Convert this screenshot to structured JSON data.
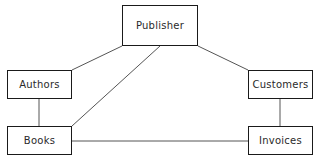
{
  "diagram": {
    "type": "entity-relationship",
    "canvas": {
      "width": 318,
      "height": 165
    },
    "style": {
      "background_color": "#ffffff",
      "box_border_color": "#1a1a1a",
      "box_fill_color": "#ffffff",
      "line_color": "#555555",
      "text_color": "#2a2a2a"
    },
    "nodes": [
      {
        "id": "publisher",
        "label": "Publisher",
        "x": 122,
        "y": 5,
        "width": 76,
        "height": 41
      },
      {
        "id": "authors",
        "label": "Authors",
        "x": 7,
        "y": 70,
        "width": 65,
        "height": 29
      },
      {
        "id": "customers",
        "label": "Customers",
        "x": 248,
        "y": 70,
        "width": 65,
        "height": 29
      },
      {
        "id": "books",
        "label": "Books",
        "x": 7,
        "y": 126,
        "width": 65,
        "height": 29
      },
      {
        "id": "invoices",
        "label": "Invoices",
        "x": 248,
        "y": 126,
        "width": 65,
        "height": 29
      }
    ],
    "edges": [
      {
        "id": "publisher-authors",
        "from": "publisher",
        "to": "authors",
        "x1": 122,
        "y1": 46,
        "x2": 72,
        "y2": 70
      },
      {
        "id": "publisher-customers",
        "from": "publisher",
        "to": "customers",
        "x1": 198,
        "y1": 46,
        "x2": 248,
        "y2": 70
      },
      {
        "id": "publisher-books",
        "from": "publisher",
        "to": "books",
        "x1": 160,
        "y1": 46,
        "x2": 72,
        "y2": 126
      },
      {
        "id": "authors-books",
        "from": "authors",
        "to": "books",
        "x1": 39,
        "y1": 99,
        "x2": 39,
        "y2": 126
      },
      {
        "id": "customers-invoices",
        "from": "customers",
        "to": "invoices",
        "x1": 280,
        "y1": 99,
        "x2": 280,
        "y2": 126
      },
      {
        "id": "books-invoices",
        "from": "books",
        "to": "invoices",
        "x1": 72,
        "y1": 141,
        "x2": 248,
        "y2": 141
      }
    ]
  }
}
